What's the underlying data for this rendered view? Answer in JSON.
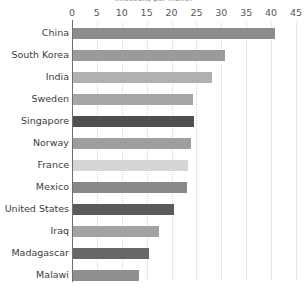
{
  "chart_data": {
    "type": "bar",
    "orientation": "horizontal",
    "title": "Infections per month",
    "xlabel": "",
    "ylabel": "",
    "xlim": [
      0,
      45
    ],
    "ticks": [
      0,
      5,
      10,
      15,
      20,
      25,
      30,
      35,
      40,
      45
    ],
    "grid": true,
    "legend": "none",
    "categories": [
      "China",
      "South Korea",
      "India",
      "Sweden",
      "Singapore",
      "Norway",
      "France",
      "Mexico",
      "United States",
      "Iraq",
      "Madagascar",
      "Malawi"
    ],
    "values": [
      40.6,
      30.5,
      28.0,
      24.2,
      24.4,
      23.8,
      23.2,
      23.0,
      20.2,
      17.3,
      15.3,
      13.3
    ],
    "colors": [
      "#8c8c8c",
      "#9b9b9b",
      "#b0b0b0",
      "#a6a6a6",
      "#4f4f4f",
      "#9e9e9e",
      "#d6d6d6",
      "#888888",
      "#5a5a5a",
      "#a3a3a3",
      "#676767",
      "#8f8f8f"
    ]
  },
  "axis": {
    "tick_color": "#54595d",
    "line_color": "#6f6f6f",
    "grid_color": "#d2d2d2"
  },
  "layout": {
    "x0_px": 72,
    "px_per_unit": 4.978,
    "row0_top_px": 22,
    "row_pitch_px": 22
  }
}
